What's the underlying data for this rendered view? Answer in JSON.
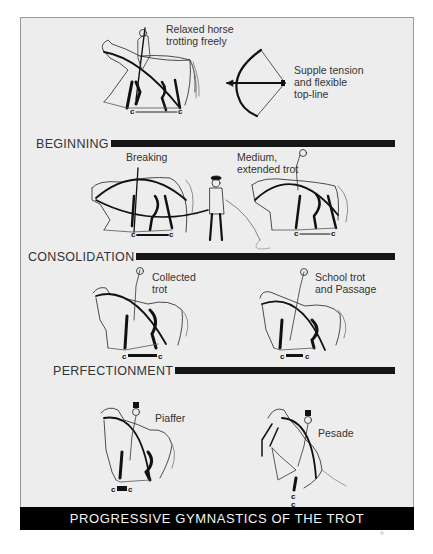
{
  "diagram": {
    "title": "PROGRESSIVE GYMNASTICS OF THE TROT",
    "colors": {
      "background": "#ededed",
      "ink": "#151515",
      "footer_bg": "#000000",
      "footer_text": "#f4f4f4"
    },
    "intro": {
      "horse_label": "Relaxed horse\ntrotting freely",
      "bow_label": "Supple tension\nand flexible\ntop-line",
      "stride_mark": "C———C"
    },
    "sections": [
      {
        "title": "BEGINNING",
        "figures": [
          {
            "label": "Breaking",
            "stride_mark": "C———C"
          },
          {
            "label": "Medium,\nextended trot",
            "stride_mark": "C———C"
          }
        ]
      },
      {
        "title": "CONSOLIDATION",
        "figures": [
          {
            "label": "Collected\ntrot",
            "stride_mark": "C▬▬C"
          },
          {
            "label": "School trot\nand Passage",
            "stride_mark": "C▬C"
          }
        ]
      },
      {
        "title": "PERFECTIONMENT",
        "figures": [
          {
            "label": "Piaffer",
            "stride_mark": "C■C"
          },
          {
            "label": "Pesade",
            "stride_mark": "C/C stacked"
          }
        ]
      }
    ]
  }
}
